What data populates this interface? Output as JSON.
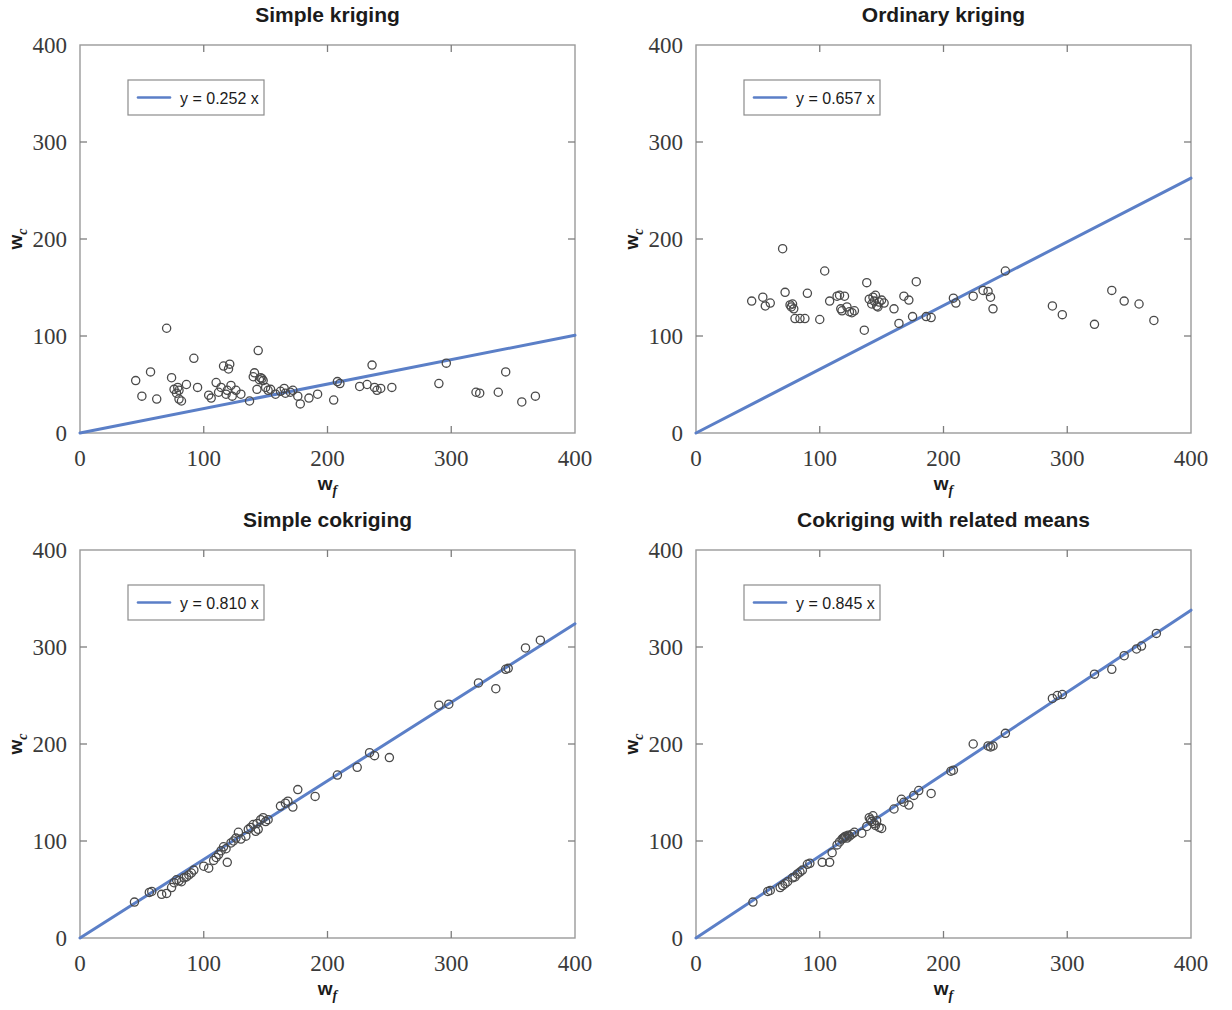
{
  "figure": {
    "background": "#ffffff",
    "layout": "2x2 panel grid",
    "marker_style": "open circle",
    "marker_color": "#4a4a4a",
    "line_color": "#5b7fc7",
    "axis_color": "#9a9a9a"
  },
  "chart_data": [
    {
      "type": "scatter",
      "panel": "top-left",
      "title": "Simple kriging",
      "xlabel": "w",
      "xlabel_sub": "f",
      "ylabel": "w",
      "ylabel_sub": "c",
      "xlim": [
        0,
        400
      ],
      "ylim": [
        0,
        400
      ],
      "xticks": [
        0,
        100,
        200,
        300,
        400
      ],
      "yticks": [
        0,
        100,
        200,
        300,
        400
      ],
      "xticklabels": [
        "0",
        "100",
        "200",
        "300",
        "400"
      ],
      "yticklabels": [
        "0",
        "100",
        "200",
        "300",
        "400"
      ],
      "grid": false,
      "legend": {
        "position": "upper left",
        "label": "y = 0.252 x",
        "slope": 0.252
      },
      "fit_line": {
        "slope": 0.252,
        "intercept": 0,
        "x0": 0,
        "x1": 400
      },
      "points": [
        [
          45,
          54
        ],
        [
          50,
          38
        ],
        [
          57,
          63
        ],
        [
          62,
          35
        ],
        [
          70,
          108
        ],
        [
          74,
          57
        ],
        [
          76,
          45
        ],
        [
          78,
          41
        ],
        [
          79,
          47
        ],
        [
          80,
          44
        ],
        [
          80,
          35
        ],
        [
          82,
          33
        ],
        [
          86,
          50
        ],
        [
          92,
          77
        ],
        [
          95,
          47
        ],
        [
          104,
          39
        ],
        [
          106,
          36
        ],
        [
          110,
          52
        ],
        [
          112,
          42
        ],
        [
          114,
          47
        ],
        [
          116,
          69
        ],
        [
          118,
          40
        ],
        [
          119,
          44
        ],
        [
          120,
          66
        ],
        [
          121,
          71
        ],
        [
          122,
          49
        ],
        [
          123,
          38
        ],
        [
          126,
          44
        ],
        [
          130,
          40
        ],
        [
          137,
          33
        ],
        [
          140,
          58
        ],
        [
          141,
          62
        ],
        [
          143,
          45
        ],
        [
          144,
          85
        ],
        [
          145,
          55
        ],
        [
          146,
          57
        ],
        [
          147,
          56
        ],
        [
          148,
          54
        ],
        [
          150,
          47
        ],
        [
          152,
          44
        ],
        [
          154,
          45
        ],
        [
          158,
          40
        ],
        [
          162,
          43
        ],
        [
          165,
          46
        ],
        [
          166,
          41
        ],
        [
          170,
          42
        ],
        [
          172,
          44
        ],
        [
          176,
          38
        ],
        [
          178,
          30
        ],
        [
          185,
          36
        ],
        [
          192,
          40
        ],
        [
          205,
          34
        ],
        [
          208,
          53
        ],
        [
          210,
          51
        ],
        [
          226,
          48
        ],
        [
          232,
          50
        ],
        [
          236,
          70
        ],
        [
          238,
          47
        ],
        [
          240,
          44
        ],
        [
          243,
          46
        ],
        [
          252,
          47
        ],
        [
          290,
          51
        ],
        [
          296,
          72
        ],
        [
          320,
          42
        ],
        [
          323,
          41
        ],
        [
          338,
          42
        ],
        [
          344,
          63
        ],
        [
          357,
          32
        ],
        [
          368,
          38
        ]
      ]
    },
    {
      "type": "scatter",
      "panel": "top-right",
      "title": "Ordinary kriging",
      "xlabel": "w",
      "xlabel_sub": "f",
      "ylabel": "w",
      "ylabel_sub": "c",
      "xlim": [
        0,
        400
      ],
      "ylim": [
        0,
        400
      ],
      "xticks": [
        0,
        100,
        200,
        300,
        400
      ],
      "yticks": [
        0,
        100,
        200,
        300,
        400
      ],
      "xticklabels": [
        "0",
        "100",
        "200",
        "300",
        "400"
      ],
      "yticklabels": [
        "0",
        "100",
        "200",
        "300",
        "400"
      ],
      "grid": false,
      "legend": {
        "position": "upper left",
        "label": "y = 0.657 x",
        "slope": 0.657
      },
      "fit_line": {
        "slope": 0.657,
        "intercept": 0,
        "x0": 0,
        "x1": 400
      },
      "points": [
        [
          45,
          136
        ],
        [
          54,
          140
        ],
        [
          56,
          131
        ],
        [
          60,
          134
        ],
        [
          70,
          190
        ],
        [
          72,
          145
        ],
        [
          76,
          132
        ],
        [
          77,
          130
        ],
        [
          78,
          133
        ],
        [
          79,
          128
        ],
        [
          80,
          118
        ],
        [
          84,
          118
        ],
        [
          88,
          118
        ],
        [
          90,
          144
        ],
        [
          100,
          117
        ],
        [
          104,
          167
        ],
        [
          108,
          136
        ],
        [
          114,
          141
        ],
        [
          116,
          142
        ],
        [
          117,
          128
        ],
        [
          118,
          126
        ],
        [
          120,
          141
        ],
        [
          122,
          130
        ],
        [
          124,
          125
        ],
        [
          126,
          124
        ],
        [
          128,
          126
        ],
        [
          136,
          106
        ],
        [
          138,
          155
        ],
        [
          140,
          138
        ],
        [
          142,
          133
        ],
        [
          143,
          140
        ],
        [
          144,
          136
        ],
        [
          145,
          142
        ],
        [
          146,
          131
        ],
        [
          147,
          130
        ],
        [
          148,
          135
        ],
        [
          150,
          137
        ],
        [
          152,
          134
        ],
        [
          160,
          128
        ],
        [
          164,
          113
        ],
        [
          168,
          141
        ],
        [
          172,
          137
        ],
        [
          175,
          120
        ],
        [
          178,
          156
        ],
        [
          186,
          120
        ],
        [
          190,
          119
        ],
        [
          208,
          139
        ],
        [
          210,
          134
        ],
        [
          224,
          141
        ],
        [
          232,
          147
        ],
        [
          236,
          146
        ],
        [
          238,
          140
        ],
        [
          240,
          128
        ],
        [
          250,
          167
        ],
        [
          288,
          131
        ],
        [
          296,
          122
        ],
        [
          322,
          112
        ],
        [
          336,
          147
        ],
        [
          346,
          136
        ],
        [
          358,
          133
        ],
        [
          370,
          116
        ]
      ]
    },
    {
      "type": "scatter",
      "panel": "bottom-left",
      "title": "Simple cokriging",
      "xlabel": "w",
      "xlabel_sub": "f",
      "ylabel": "w",
      "ylabel_sub": "c",
      "xlim": [
        0,
        400
      ],
      "ylim": [
        0,
        400
      ],
      "xticks": [
        0,
        100,
        200,
        300,
        400
      ],
      "yticks": [
        0,
        100,
        200,
        300,
        400
      ],
      "xticklabels": [
        "0",
        "100",
        "200",
        "300",
        "400"
      ],
      "yticklabels": [
        "0",
        "100",
        "200",
        "300",
        "400"
      ],
      "grid": false,
      "legend": {
        "position": "upper left",
        "label": "y = 0.810 x",
        "slope": 0.81
      },
      "fit_line": {
        "slope": 0.81,
        "intercept": 0,
        "x0": 0,
        "x1": 400
      },
      "points": [
        [
          44,
          37
        ],
        [
          56,
          47
        ],
        [
          58,
          48
        ],
        [
          66,
          45
        ],
        [
          70,
          46
        ],
        [
          74,
          52
        ],
        [
          76,
          57
        ],
        [
          78,
          60
        ],
        [
          80,
          59
        ],
        [
          82,
          58
        ],
        [
          84,
          62
        ],
        [
          86,
          63
        ],
        [
          88,
          65
        ],
        [
          90,
          67
        ],
        [
          92,
          70
        ],
        [
          100,
          74
        ],
        [
          104,
          72
        ],
        [
          108,
          80
        ],
        [
          110,
          83
        ],
        [
          112,
          86
        ],
        [
          114,
          90
        ],
        [
          116,
          94
        ],
        [
          118,
          92
        ],
        [
          119,
          78
        ],
        [
          122,
          98
        ],
        [
          124,
          100
        ],
        [
          126,
          103
        ],
        [
          128,
          109
        ],
        [
          130,
          102
        ],
        [
          134,
          105
        ],
        [
          136,
          112
        ],
        [
          138,
          114
        ],
        [
          140,
          117
        ],
        [
          142,
          110
        ],
        [
          143,
          118
        ],
        [
          144,
          112
        ],
        [
          146,
          122
        ],
        [
          148,
          124
        ],
        [
          150,
          120
        ],
        [
          152,
          122
        ],
        [
          162,
          136
        ],
        [
          166,
          139
        ],
        [
          168,
          141
        ],
        [
          172,
          135
        ],
        [
          176,
          153
        ],
        [
          190,
          146
        ],
        [
          208,
          168
        ],
        [
          224,
          176
        ],
        [
          234,
          191
        ],
        [
          238,
          188
        ],
        [
          250,
          186
        ],
        [
          290,
          240
        ],
        [
          298,
          241
        ],
        [
          322,
          263
        ],
        [
          336,
          257
        ],
        [
          344,
          277
        ],
        [
          346,
          278
        ],
        [
          360,
          299
        ],
        [
          372,
          307
        ]
      ]
    },
    {
      "type": "scatter",
      "panel": "bottom-right",
      "title": "Cokriging with related means",
      "xlabel": "w",
      "xlabel_sub": "f",
      "ylabel": "w",
      "ylabel_sub": "c",
      "xlim": [
        0,
        400
      ],
      "ylim": [
        0,
        400
      ],
      "xticks": [
        0,
        100,
        200,
        300,
        400
      ],
      "yticks": [
        0,
        100,
        200,
        300,
        400
      ],
      "xticklabels": [
        "0",
        "100",
        "200",
        "300",
        "400"
      ],
      "yticklabels": [
        "0",
        "100",
        "200",
        "300",
        "400"
      ],
      "grid": false,
      "legend": {
        "position": "upper left",
        "label": "y = 0.845 x",
        "slope": 0.845
      },
      "fit_line": {
        "slope": 0.845,
        "intercept": 0,
        "x0": 0,
        "x1": 400
      },
      "points": [
        [
          46,
          37
        ],
        [
          58,
          48
        ],
        [
          60,
          49
        ],
        [
          68,
          52
        ],
        [
          70,
          54
        ],
        [
          72,
          56
        ],
        [
          74,
          58
        ],
        [
          78,
          62
        ],
        [
          80,
          63
        ],
        [
          82,
          66
        ],
        [
          84,
          68
        ],
        [
          86,
          70
        ],
        [
          90,
          76
        ],
        [
          92,
          77
        ],
        [
          102,
          78
        ],
        [
          108,
          78
        ],
        [
          110,
          88
        ],
        [
          114,
          96
        ],
        [
          116,
          99
        ],
        [
          118,
          102
        ],
        [
          119,
          103
        ],
        [
          120,
          104
        ],
        [
          121,
          105
        ],
        [
          122,
          103
        ],
        [
          123,
          106
        ],
        [
          124,
          105
        ],
        [
          126,
          107
        ],
        [
          128,
          109
        ],
        [
          134,
          108
        ],
        [
          138,
          115
        ],
        [
          140,
          124
        ],
        [
          141,
          122
        ],
        [
          142,
          120
        ],
        [
          143,
          126
        ],
        [
          144,
          118
        ],
        [
          145,
          116
        ],
        [
          146,
          121
        ],
        [
          148,
          114
        ],
        [
          150,
          113
        ],
        [
          160,
          133
        ],
        [
          166,
          143
        ],
        [
          168,
          140
        ],
        [
          172,
          137
        ],
        [
          176,
          147
        ],
        [
          180,
          152
        ],
        [
          190,
          149
        ],
        [
          206,
          172
        ],
        [
          208,
          173
        ],
        [
          224,
          200
        ],
        [
          236,
          198
        ],
        [
          238,
          197
        ],
        [
          240,
          198
        ],
        [
          250,
          211
        ],
        [
          288,
          247
        ],
        [
          292,
          250
        ],
        [
          296,
          251
        ],
        [
          322,
          272
        ],
        [
          336,
          277
        ],
        [
          346,
          291
        ],
        [
          356,
          298
        ],
        [
          360,
          301
        ],
        [
          372,
          314
        ]
      ]
    }
  ]
}
